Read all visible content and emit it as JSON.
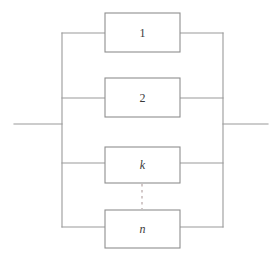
{
  "diagram": {
    "type": "reliability-block-diagram",
    "arrangement": "parallel",
    "title": "",
    "colors": {
      "line": "#9a9a9a",
      "box_border": "#8f8f8f",
      "box_fill": "#ffffff",
      "dashed_connector": "#c9bcbc",
      "label_text": "#3a3a3a",
      "background": "#ffffff"
    },
    "blocks": [
      {
        "id": "block-1",
        "label": "1",
        "italic": false,
        "x": 105,
        "y": 13,
        "width": 75,
        "height": 39,
        "wire_y": 33
      },
      {
        "id": "block-2",
        "label": "2",
        "italic": false,
        "x": 105,
        "y": 78,
        "width": 75,
        "height": 39,
        "wire_y": 98
      },
      {
        "id": "block-k",
        "label": "k",
        "italic": true,
        "x": 105,
        "y": 147,
        "width": 75,
        "height": 36,
        "wire_y": 163
      },
      {
        "id": "block-n",
        "label": "n",
        "italic": true,
        "x": 105,
        "y": 210,
        "width": 75,
        "height": 38,
        "wire_y": 227
      }
    ],
    "buses": {
      "left_x": 62,
      "right_x": 223,
      "top_y": 33,
      "bottom_y": 227
    },
    "terminals": {
      "input_line": {
        "x1": 14,
        "x2": 62,
        "y": 124
      },
      "output_line": {
        "x1": 223,
        "x2": 268,
        "y": 124
      }
    },
    "ellipsis": {
      "label": "vertical-dashed-continuation",
      "x": 142,
      "y1": 184,
      "y2": 209
    }
  }
}
